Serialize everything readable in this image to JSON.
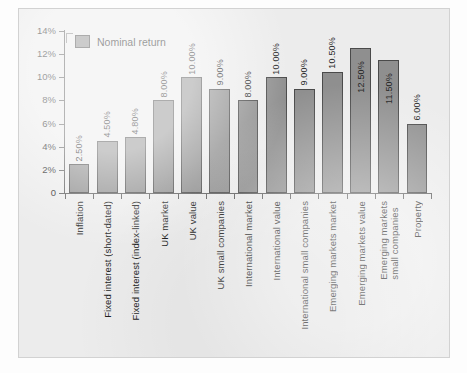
{
  "chart_data": {
    "type": "bar",
    "title": "",
    "subtitle": "",
    "xlabel": "",
    "ylabel": "",
    "ylim": [
      0,
      14
    ],
    "ytick_values": [
      0,
      2,
      4,
      6,
      8,
      10,
      12,
      14
    ],
    "ytick_labels": [
      "0",
      "2%",
      "4%",
      "6%",
      "8%",
      "10%",
      "12%",
      "14%"
    ],
    "grid": false,
    "legend_position": "top-left",
    "value_label_format": "0.00%",
    "value_label_rotation": -90,
    "xlabel_rotation": -90,
    "categories": [
      "Inflation",
      "Fixed interest (short-dated)",
      "Fixed interest (index-linked)",
      "UK market",
      "UK value",
      "UK small companies",
      "International market",
      "International value",
      "International small companies",
      "Emerging markets market",
      "Emerging markets value",
      "Emerging markets\nsmall companies",
      "Property"
    ],
    "series": [
      {
        "name": "Nominal return",
        "color": "#8f8f8f",
        "values": [
          2.5,
          4.5,
          4.8,
          8.0,
          10.0,
          9.0,
          8.0,
          10.0,
          9.0,
          10.5,
          12.5,
          11.5,
          6.0
        ],
        "value_labels": [
          "2.50%",
          "4.50%",
          "4.80%",
          "8.00%",
          "10.00%",
          "9.00%",
          "8.00%",
          "10.00%",
          "9.00%",
          "10.50%",
          "12.50%",
          "11.50%",
          "6.00%"
        ],
        "label_inside": [
          false,
          false,
          false,
          false,
          false,
          false,
          false,
          false,
          false,
          false,
          true,
          true,
          false
        ]
      }
    ]
  },
  "legend": {
    "items": [
      {
        "label": "Nominal return",
        "color": "#8f8f8f"
      }
    ]
  },
  "colors": {
    "bar_fill": "#8f8f8f",
    "bar_stroke": "#4a4a4a",
    "panel_background": "#ececec",
    "page_background": "#fdfdfd",
    "axis": "#5d5d5d",
    "text": "#1f1f1f"
  }
}
